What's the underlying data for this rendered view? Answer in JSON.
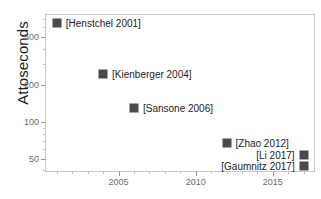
{
  "chart_data": {
    "type": "scatter",
    "title": "",
    "xlabel": "",
    "ylabel": "Attoseconds",
    "yscale": "log",
    "xlim": [
      2000.3,
      2017.8
    ],
    "ylim": [
      38,
      760
    ],
    "grid": false,
    "legend": "none",
    "x": [
      2001,
      2004,
      2006,
      2012,
      2017,
      2017
    ],
    "y": [
      650,
      250,
      130,
      67,
      53,
      43
    ],
    "point_labels": [
      "[Henstchel 2001]",
      "[Kienberger 2004]",
      "[Sansone 2006]",
      "[Zhao 2012]",
      "[Li 2017]",
      "[Gaumnitz 2017]"
    ],
    "points": [
      {
        "label": "[Henstchel 2001]",
        "x": 2001,
        "y": 650,
        "label_side": "right"
      },
      {
        "label": "[Kienberger 2004]",
        "x": 2004,
        "y": 250,
        "label_side": "right"
      },
      {
        "label": "[Sansone 2006]",
        "x": 2006,
        "y": 130,
        "label_side": "right"
      },
      {
        "label": "[Zhao 2012]",
        "x": 2012,
        "y": 67,
        "label_side": "right"
      },
      {
        "label": "[Li 2017]",
        "x": 2017,
        "y": 53,
        "label_side": "left"
      },
      {
        "label": "[Gaumnitz 2017]",
        "x": 2017,
        "y": 43,
        "label_side": "left"
      }
    ],
    "xticks": [
      2005,
      2010,
      2015
    ],
    "xtick_labels": [
      "2005",
      "2010",
      "2015"
    ],
    "yticks": [
      50,
      100,
      200,
      500
    ],
    "ytick_labels": [
      "50",
      "100",
      "200",
      "500"
    ],
    "marker_color": "#4a4a4a",
    "axis_color": "#c8c8c8",
    "tick_label_color": "#6d6d6d",
    "text_color": "#1d1d1d"
  }
}
